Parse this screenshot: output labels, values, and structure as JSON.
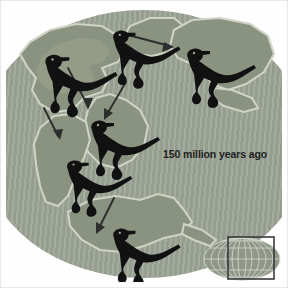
{
  "figure": {
    "kind": "paleogeographic-map",
    "caption_label": "150 million years ago",
    "era": "Late Jurassic"
  },
  "colors": {
    "ocean": "#9aa394",
    "land": "#8a9280",
    "coast_outline": "#cfd3c6",
    "dinosaur": "#111111",
    "arrow": "#2e2e2e",
    "label_text": "#1f1f1f",
    "frame": "#fefefe",
    "inset_globe": "#8e9788",
    "inset_graticule": "#d7dbd0",
    "inset_rect_stroke": "#3a3a3a"
  },
  "map": {
    "landmasses": [
      {
        "id": "laurentia-north-america",
        "position": "upper-left"
      },
      {
        "id": "europe-laurasia",
        "position": "upper-center"
      },
      {
        "id": "asia-siberia",
        "position": "upper-right"
      },
      {
        "id": "africa",
        "position": "center"
      },
      {
        "id": "south-america",
        "position": "center-left"
      },
      {
        "id": "antarctica-australia",
        "position": "lower-center"
      }
    ],
    "dinosaurs": [
      {
        "id": "dinosaur-north-america",
        "x": 58,
        "y": 52,
        "scale": 1.0,
        "flip": false
      },
      {
        "id": "dinosaur-europe",
        "x": 125,
        "y": 32,
        "scale": 0.92,
        "flip": false
      },
      {
        "id": "dinosaur-asia",
        "x": 200,
        "y": 48,
        "scale": 0.95,
        "flip": false
      },
      {
        "id": "dinosaur-africa",
        "x": 100,
        "y": 122,
        "scale": 0.95,
        "flip": false
      },
      {
        "id": "dinosaur-south-america",
        "x": 78,
        "y": 162,
        "scale": 0.9,
        "flip": false
      },
      {
        "id": "dinosaur-antarctica",
        "x": 125,
        "y": 230,
        "scale": 0.92,
        "flip": false
      }
    ],
    "drift_arrows": [
      {
        "id": "arrow-north-america-southeast",
        "direction": "down-right"
      },
      {
        "id": "arrow-europe-east",
        "direction": "right"
      },
      {
        "id": "arrow-africa-northeast-source",
        "direction": "down-left"
      },
      {
        "id": "arrow-south-america-southwest",
        "direction": "down-right"
      },
      {
        "id": "arrow-antarctica-southwest",
        "direction": "down-left"
      }
    ]
  },
  "inset": {
    "name": "globe-locator-inset",
    "globe_label": "globe",
    "highlight_rect": {
      "x": 26,
      "y": 3,
      "width": 46,
      "height": 42
    }
  }
}
